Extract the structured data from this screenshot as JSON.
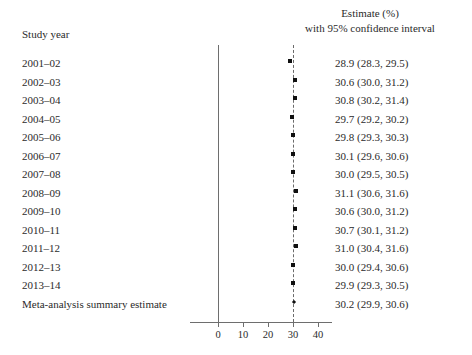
{
  "header": {
    "left_label": "Study year",
    "right_line1": "Estimate (%)",
    "right_line2": "with 95% confidence interval"
  },
  "axis": {
    "ticks": [
      "0",
      "10",
      "20",
      "30",
      "40"
    ]
  },
  "rows": [
    {
      "label": "2001–02",
      "estimate": "28.9 (28.3, 29.5)"
    },
    {
      "label": "2002–03",
      "estimate": "30.6 (30.0, 31.2)"
    },
    {
      "label": "2003–04",
      "estimate": "30.8 (30.2, 31.4)"
    },
    {
      "label": "2004–05",
      "estimate": "29.7 (29.2, 30.2)"
    },
    {
      "label": "2005–06",
      "estimate": "29.8 (29.3, 30.3)"
    },
    {
      "label": "2006–07",
      "estimate": "30.1 (29.6, 30.6)"
    },
    {
      "label": "2007–08",
      "estimate": "30.0 (29.5, 30.5)"
    },
    {
      "label": "2008–09",
      "estimate": "31.1 (30.6, 31.6)"
    },
    {
      "label": "2009–10",
      "estimate": "30.6 (30.0, 31.2)"
    },
    {
      "label": "2010–11",
      "estimate": "30.7 (30.1, 31.2)"
    },
    {
      "label": "2011–12",
      "estimate": "31.0 (30.4, 31.6)"
    },
    {
      "label": "2012–13",
      "estimate": "30.0 (29.4, 30.6)"
    },
    {
      "label": "2013–14",
      "estimate": "29.9 (29.3, 30.5)"
    },
    {
      "label": "Meta-analysis summary estimate",
      "estimate": "30.2 (29.9, 30.6)"
    }
  ],
  "chart_data": {
    "type": "forest",
    "title": "",
    "xlabel": "",
    "ylabel": "",
    "xlim": [
      -11,
      45
    ],
    "xticks": [
      0,
      10,
      20,
      30,
      40
    ],
    "grid": false,
    "reference_line": 30,
    "categories": [
      "2001–02",
      "2002–03",
      "2003–04",
      "2004–05",
      "2005–06",
      "2006–07",
      "2007–08",
      "2008–09",
      "2009–10",
      "2010–11",
      "2011–12",
      "2012–13",
      "2013–14",
      "Meta-analysis summary estimate"
    ],
    "points": [
      {
        "label": "2001–02",
        "value": 28.9,
        "low": 28.3,
        "high": 29.5,
        "summary": false
      },
      {
        "label": "2002–03",
        "value": 30.6,
        "low": 30.0,
        "high": 31.2,
        "summary": false
      },
      {
        "label": "2003–04",
        "value": 30.8,
        "low": 30.2,
        "high": 31.4,
        "summary": false
      },
      {
        "label": "2004–05",
        "value": 29.7,
        "low": 29.2,
        "high": 30.2,
        "summary": false
      },
      {
        "label": "2005–06",
        "value": 29.8,
        "low": 29.3,
        "high": 30.3,
        "summary": false
      },
      {
        "label": "2006–07",
        "value": 30.1,
        "low": 29.6,
        "high": 30.6,
        "summary": false
      },
      {
        "label": "2007–08",
        "value": 30.0,
        "low": 29.5,
        "high": 30.5,
        "summary": false
      },
      {
        "label": "2008–09",
        "value": 31.1,
        "low": 30.6,
        "high": 31.6,
        "summary": false
      },
      {
        "label": "2009–10",
        "value": 30.6,
        "low": 30.0,
        "high": 31.2,
        "summary": false
      },
      {
        "label": "2010–11",
        "value": 30.7,
        "low": 30.1,
        "high": 31.2,
        "summary": false
      },
      {
        "label": "2011–12",
        "value": 31.0,
        "low": 30.4,
        "high": 31.6,
        "summary": false
      },
      {
        "label": "2012–13",
        "value": 30.0,
        "low": 29.4,
        "high": 30.6,
        "summary": false
      },
      {
        "label": "2013–14",
        "value": 29.9,
        "low": 29.3,
        "high": 30.5,
        "summary": false
      },
      {
        "label": "Meta-analysis summary estimate",
        "value": 30.2,
        "low": 29.9,
        "high": 30.6,
        "summary": true
      }
    ]
  }
}
